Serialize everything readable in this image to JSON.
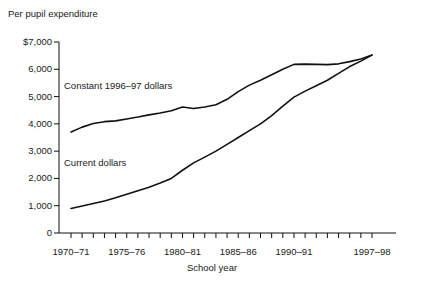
{
  "chart_data": {
    "type": "line",
    "title": "Per pupil expenditure",
    "xlabel": "School year",
    "ylabel": "",
    "ylim": [
      0,
      7000
    ],
    "grid": false,
    "legend_position": "inline-annotation",
    "y_ticks": [
      "0",
      "1,000",
      "2,000",
      "3,000",
      "4,000",
      "5,000",
      "6,000",
      "$7,000"
    ],
    "y_tick_values": [
      0,
      1000,
      2000,
      3000,
      4000,
      5000,
      6000,
      7000
    ],
    "x_tick_labels": [
      "1970–71",
      "1975–76",
      "1980–81",
      "1985–86",
      "1990–91",
      "1997–98"
    ],
    "x_tick_positions": [
      0,
      5,
      10,
      15,
      20,
      27
    ],
    "x_minor_tick_count": 28,
    "categories": [
      "1970-71",
      "1971-72",
      "1972-73",
      "1973-74",
      "1974-75",
      "1975-76",
      "1976-77",
      "1977-78",
      "1978-79",
      "1979-80",
      "1980-81",
      "1981-82",
      "1982-83",
      "1983-84",
      "1984-85",
      "1985-86",
      "1986-87",
      "1987-88",
      "1988-89",
      "1989-90",
      "1990-91",
      "1991-92",
      "1992-93",
      "1993-94",
      "1994-95",
      "1995-96",
      "1996-97",
      "1997-98"
    ],
    "series": [
      {
        "name": "Constant 1996–97 dollars",
        "color": "#111111",
        "values": [
          3700,
          3880,
          4010,
          4080,
          4110,
          4180,
          4250,
          4330,
          4400,
          4480,
          4620,
          4560,
          4620,
          4700,
          4900,
          5180,
          5420,
          5600,
          5800,
          6000,
          6180,
          6190,
          6180,
          6170,
          6200,
          6280,
          6380,
          6520
        ]
      },
      {
        "name": "Current dollars",
        "color": "#111111",
        "values": [
          900,
          990,
          1080,
          1170,
          1290,
          1420,
          1550,
          1680,
          1830,
          2000,
          2300,
          2570,
          2780,
          3000,
          3250,
          3500,
          3750,
          4000,
          4300,
          4650,
          4980,
          5200,
          5400,
          5600,
          5850,
          6100,
          6300,
          6520
        ]
      }
    ],
    "annotations": [
      {
        "text": "Constant 1996–97 dollars",
        "x_px": 64,
        "y_px": 80
      },
      {
        "text": "Current dollars",
        "x_px": 64,
        "y_px": 157
      }
    ]
  }
}
